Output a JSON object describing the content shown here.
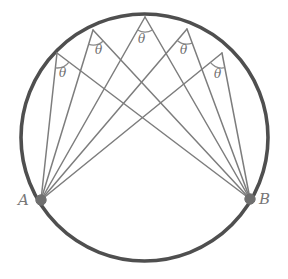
{
  "figure": {
    "type": "geometry-diagram",
    "canvas": {
      "width": 288,
      "height": 279,
      "background": "#ffffff"
    },
    "colors": {
      "circle_stroke": "#4f4f4f",
      "chord_stroke": "#7d7d7d",
      "vertex_dot": "#6f6f6f",
      "arc_marker": "#8a8a8a",
      "label_text": "#6e6e6e"
    },
    "circle": {
      "cx": 144.5,
      "cy": 137.5,
      "r": 123.5,
      "stroke_width": 3.6
    },
    "endpoints": [
      {
        "id": "A",
        "label": "A",
        "x": 41,
        "y": 200,
        "label_x": 18,
        "label_y": 191,
        "dot_r": 5.2
      },
      {
        "id": "B",
        "label": "B",
        "x": 250,
        "y": 199,
        "label_x": 259,
        "label_y": 190,
        "dot_r": 5.2
      }
    ],
    "apex_points": [
      {
        "id": "P1",
        "x": 57,
        "y": 53,
        "theta_label": "θ",
        "theta_x": 59,
        "theta_y": 66,
        "arc_r": 15
      },
      {
        "id": "P2",
        "x": 93,
        "y": 30,
        "theta_label": "θ",
        "theta_x": 95,
        "theta_y": 43,
        "arc_r": 15
      },
      {
        "id": "P3",
        "x": 145,
        "y": 17,
        "theta_label": "θ",
        "theta_x": 138,
        "theta_y": 32,
        "arc_r": 15
      },
      {
        "id": "P4",
        "x": 187,
        "y": 29,
        "theta_label": "θ",
        "theta_x": 180,
        "theta_y": 43,
        "arc_r": 15
      },
      {
        "id": "P5",
        "x": 222,
        "y": 53,
        "theta_label": "θ",
        "theta_x": 214,
        "theta_y": 67,
        "arc_r": 15
      }
    ],
    "chord_stroke_width": 1.5,
    "caption": ""
  },
  "chart_data": {
    "type": "scatter",
    "xlabel": "",
    "ylabel": "",
    "annotations": [
      "θ",
      "θ",
      "θ",
      "θ",
      "θ",
      "A",
      "B"
    ],
    "series": [
      {
        "name": "apex points on major arc",
        "x": [
          57,
          93,
          145,
          187,
          222
        ],
        "y": [
          53,
          30,
          17,
          29,
          53
        ]
      },
      {
        "name": "chord endpoints",
        "x": [
          41,
          250
        ],
        "y": [
          200,
          199
        ]
      }
    ]
  }
}
